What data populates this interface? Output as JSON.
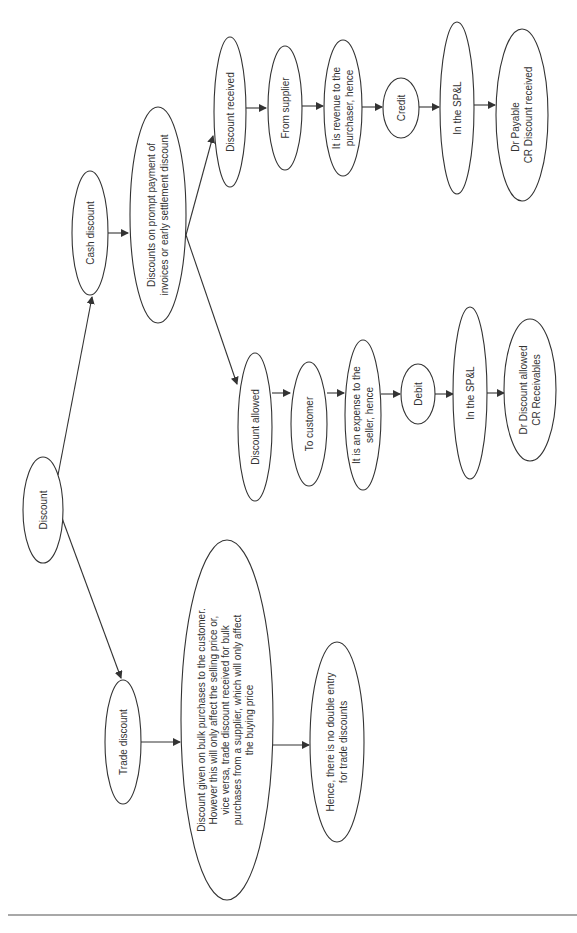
{
  "diagram": {
    "title": "Discount",
    "orientation": "rotated -90deg (reads bottom-to-top)",
    "nodes": {
      "discount": {
        "lines": [
          "Discount"
        ]
      },
      "cash_discount": {
        "lines": [
          "Cash discount"
        ]
      },
      "cash_definition": {
        "lines": [
          "Discounts on prompt payment of",
          "invoices or early settlement discount"
        ]
      },
      "discount_received": {
        "lines": [
          "Discount received"
        ]
      },
      "from_supplier": {
        "lines": [
          "From supplier"
        ]
      },
      "revenue_to_purchaser": {
        "lines": [
          "It is revenue to the",
          "purchaser, hence"
        ]
      },
      "credit": {
        "lines": [
          "Credit"
        ]
      },
      "in_spl_received": {
        "lines": [
          "In the SP&L"
        ]
      },
      "entry_received": {
        "lines": [
          "Dr Payable",
          "CR Discount received"
        ]
      },
      "discount_allowed": {
        "lines": [
          "Discount allowed"
        ]
      },
      "to_customer": {
        "lines": [
          "To customer"
        ]
      },
      "expense_to_seller": {
        "lines": [
          "It is an expense to the",
          "seller, hence"
        ]
      },
      "debit": {
        "lines": [
          "Debit"
        ]
      },
      "in_spl_allowed": {
        "lines": [
          "In the SP&L"
        ]
      },
      "entry_allowed": {
        "lines": [
          "Dr Discount allowed",
          "CR Receivables"
        ]
      },
      "trade_discount": {
        "lines": [
          "Trade discount"
        ]
      },
      "trade_definition": {
        "lines": [
          "Discount given on bulk purchases to the customer.",
          "However this will only affect the selling price or,",
          "vice versa, trade discount received for bulk",
          "purchases from a supplier, which will only affect",
          "the buying price"
        ]
      },
      "no_double_entry": {
        "lines": [
          "Hence, there is no double entry",
          "for trade discounts"
        ]
      }
    },
    "edges": [
      [
        "discount",
        "cash_discount"
      ],
      [
        "discount",
        "trade_discount"
      ],
      [
        "cash_discount",
        "cash_definition"
      ],
      [
        "cash_definition",
        "discount_received"
      ],
      [
        "cash_definition",
        "discount_allowed"
      ],
      [
        "discount_received",
        "from_supplier"
      ],
      [
        "from_supplier",
        "revenue_to_purchaser"
      ],
      [
        "revenue_to_purchaser",
        "credit"
      ],
      [
        "credit",
        "in_spl_received"
      ],
      [
        "in_spl_received",
        "entry_received"
      ],
      [
        "discount_allowed",
        "to_customer"
      ],
      [
        "to_customer",
        "expense_to_seller"
      ],
      [
        "expense_to_seller",
        "debit"
      ],
      [
        "debit",
        "in_spl_allowed"
      ],
      [
        "in_spl_allowed",
        "entry_allowed"
      ],
      [
        "trade_discount",
        "trade_definition"
      ],
      [
        "trade_definition",
        "no_double_entry"
      ]
    ],
    "colors": {
      "stroke": "#333333",
      "text": "#333333",
      "background": "#ffffff",
      "rule": "#a8a8a8"
    }
  }
}
